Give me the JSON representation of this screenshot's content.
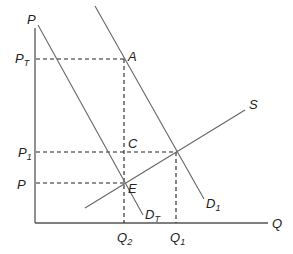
{
  "diagram": {
    "type": "supply-demand",
    "axes": {
      "y_label": "P",
      "x_label": "Q"
    },
    "curves": [
      {
        "id": "D1",
        "label": "D",
        "label_sub": "1",
        "kind": "demand"
      },
      {
        "id": "DT",
        "label": "D",
        "label_sub": "T",
        "kind": "demand"
      },
      {
        "id": "S",
        "label": "S",
        "label_sub": "",
        "kind": "supply"
      }
    ],
    "points": [
      {
        "id": "A",
        "label": "A"
      },
      {
        "id": "C",
        "label": "C"
      },
      {
        "id": "E",
        "label": "E"
      }
    ],
    "price_levels": [
      {
        "id": "PT",
        "label": "P",
        "label_sub": "T"
      },
      {
        "id": "P1",
        "label": "P",
        "label_sub": "1"
      },
      {
        "id": "P",
        "label": "P",
        "label_sub": ""
      }
    ],
    "quantity_levels": [
      {
        "id": "Q2",
        "label": "Q",
        "label_sub": "2"
      },
      {
        "id": "Q1",
        "label": "Q",
        "label_sub": "1"
      }
    ]
  }
}
